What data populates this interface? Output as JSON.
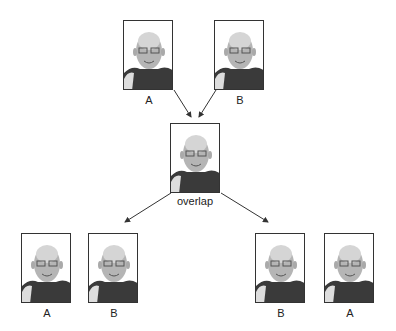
{
  "top": {
    "left": {
      "label": "A"
    },
    "right": {
      "label": "B"
    }
  },
  "center": {
    "label": "overlap"
  },
  "bottom": {
    "left_group": [
      {
        "label": "A"
      },
      {
        "label": "B"
      }
    ],
    "right_group": [
      {
        "label": "B"
      },
      {
        "label": "A"
      }
    ]
  },
  "colors": {
    "frame": "#333333",
    "arrow": "#333333"
  }
}
